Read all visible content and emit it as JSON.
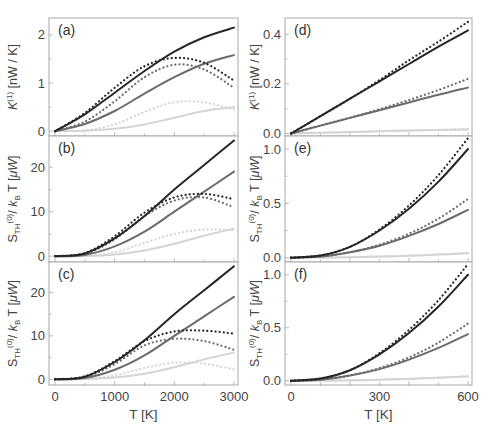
{
  "colors": {
    "dark": "#262626",
    "mid": "#6b6b6b",
    "light": "#d4d4d4",
    "frame": "#a8a8a8",
    "tick": "#444444"
  },
  "chart_data": [
    {
      "panel": "(a)",
      "type": "line",
      "column": "left",
      "ylabel": "K^(1) [nW / K]",
      "xlabel": "",
      "xlim": [
        0,
        3000
      ],
      "ylim": [
        -0.1,
        2.35
      ],
      "yticks": [
        0,
        1,
        2
      ],
      "yticklabels": [
        "0",
        "1",
        "2"
      ],
      "x": [
        0,
        500,
        1000,
        1500,
        2000,
        2500,
        3000
      ],
      "series": [
        {
          "name": "dark solid",
          "style": "solid",
          "shade": "dark",
          "values": [
            0,
            0.35,
            0.8,
            1.25,
            1.65,
            1.95,
            2.15
          ]
        },
        {
          "name": "dark dotted",
          "style": "dotted",
          "shade": "dark",
          "values": [
            0,
            0.38,
            0.9,
            1.35,
            1.52,
            1.42,
            1.05
          ]
        },
        {
          "name": "mid solid",
          "style": "solid",
          "shade": "mid",
          "values": [
            0,
            0.15,
            0.42,
            0.78,
            1.12,
            1.4,
            1.58
          ]
        },
        {
          "name": "mid dotted",
          "style": "dotted",
          "shade": "mid",
          "values": [
            0,
            0.2,
            0.62,
            1.12,
            1.38,
            1.28,
            0.9
          ]
        },
        {
          "name": "light solid",
          "style": "solid",
          "shade": "light",
          "values": [
            0,
            0.01,
            0.05,
            0.14,
            0.28,
            0.42,
            0.5
          ]
        },
        {
          "name": "light dotted",
          "style": "dotted",
          "shade": "light",
          "values": [
            0,
            0.02,
            0.14,
            0.4,
            0.6,
            0.6,
            0.45
          ]
        }
      ]
    },
    {
      "panel": "(b)",
      "type": "line",
      "column": "left",
      "ylabel": "S_TH^(0) / k_B T [μW]",
      "xlabel": "",
      "xlim": [
        0,
        3000
      ],
      "ylim": [
        -1.3,
        27
      ],
      "yticks": [
        0,
        10,
        20
      ],
      "yticklabels": [
        "0",
        "10",
        "20"
      ],
      "x": [
        0,
        500,
        1000,
        1500,
        2000,
        2500,
        3000
      ],
      "series": [
        {
          "name": "dark solid",
          "style": "solid",
          "shade": "dark",
          "values": [
            0,
            0.6,
            4,
            9,
            15,
            20.5,
            26
          ]
        },
        {
          "name": "dark dotted",
          "style": "dotted",
          "shade": "dark",
          "values": [
            0,
            0.7,
            4.5,
            9.8,
            13.2,
            14,
            12.8
          ]
        },
        {
          "name": "mid solid",
          "style": "solid",
          "shade": "mid",
          "values": [
            0,
            0.3,
            2.2,
            5.5,
            10,
            14.5,
            19
          ]
        },
        {
          "name": "mid dotted",
          "style": "dotted",
          "shade": "mid",
          "values": [
            0,
            0.5,
            3.8,
            9,
            12.5,
            13.2,
            11
          ]
        },
        {
          "name": "light solid",
          "style": "solid",
          "shade": "light",
          "values": [
            0,
            0.05,
            0.4,
            1.3,
            2.8,
            4.6,
            6.2
          ]
        },
        {
          "name": "light dotted",
          "style": "dotted",
          "shade": "light",
          "values": [
            0,
            0.1,
            0.9,
            3,
            5,
            6,
            5.8
          ]
        }
      ]
    },
    {
      "panel": "(c)",
      "type": "line",
      "column": "left",
      "ylabel": "S_TH^(0) / k_B T [μW]",
      "xlabel": "T [K]",
      "xlim": [
        0,
        3000
      ],
      "ylim": [
        -1.3,
        27
      ],
      "yticks": [
        0,
        10,
        20
      ],
      "yticklabels": [
        "0",
        "10",
        "20"
      ],
      "xticks": [
        0,
        1000,
        2000,
        3000
      ],
      "xticklabels": [
        "0",
        "1000",
        "2000",
        "3000"
      ],
      "x": [
        0,
        500,
        1000,
        1500,
        2000,
        2500,
        3000
      ],
      "series": [
        {
          "name": "dark solid",
          "style": "solid",
          "shade": "dark",
          "values": [
            0,
            0.6,
            4,
            9,
            15,
            20.5,
            26
          ]
        },
        {
          "name": "dark dotted",
          "style": "dotted",
          "shade": "dark",
          "values": [
            0,
            0.7,
            4.2,
            8.8,
            11,
            11.2,
            10.5
          ]
        },
        {
          "name": "mid solid",
          "style": "solid",
          "shade": "mid",
          "values": [
            0,
            0.3,
            2.2,
            5.5,
            10,
            14.5,
            19
          ]
        },
        {
          "name": "mid dotted",
          "style": "dotted",
          "shade": "mid",
          "values": [
            0,
            0.5,
            3.5,
            7.8,
            9.3,
            8.8,
            6.8
          ]
        },
        {
          "name": "light solid",
          "style": "solid",
          "shade": "light",
          "values": [
            0,
            0.05,
            0.4,
            1.3,
            2.8,
            4.6,
            6.2
          ]
        },
        {
          "name": "light dotted",
          "style": "dotted",
          "shade": "light",
          "values": [
            0,
            0.1,
            0.9,
            2.6,
            3.8,
            3.6,
            2.3
          ]
        }
      ]
    },
    {
      "panel": "(d)",
      "type": "line",
      "column": "right",
      "ylabel": "K^(1) [nW / K]",
      "xlabel": "",
      "xlim": [
        0,
        600
      ],
      "ylim": [
        -0.01,
        0.465
      ],
      "yticks": [
        0,
        0.2,
        0.4
      ],
      "yticklabels": [
        "0.0",
        "0.2",
        "0.4"
      ],
      "x": [
        0,
        100,
        200,
        300,
        400,
        500,
        600
      ],
      "series": [
        {
          "name": "dark solid",
          "style": "solid",
          "shade": "dark",
          "values": [
            0,
            0.07,
            0.14,
            0.21,
            0.28,
            0.35,
            0.415
          ]
        },
        {
          "name": "dark dotted",
          "style": "dotted",
          "shade": "dark",
          "values": [
            0,
            0.07,
            0.14,
            0.215,
            0.295,
            0.37,
            0.45
          ]
        },
        {
          "name": "mid solid",
          "style": "solid",
          "shade": "mid",
          "values": [
            0,
            0.032,
            0.063,
            0.094,
            0.125,
            0.156,
            0.185
          ]
        },
        {
          "name": "mid dotted",
          "style": "dotted",
          "shade": "mid",
          "values": [
            0,
            0.032,
            0.064,
            0.098,
            0.135,
            0.175,
            0.22
          ]
        },
        {
          "name": "light solid",
          "style": "solid",
          "shade": "light",
          "values": [
            0,
            0.003,
            0.006,
            0.009,
            0.012,
            0.014,
            0.016
          ]
        },
        {
          "name": "light dotted",
          "style": "dotted",
          "shade": "light",
          "values": [
            0,
            0.003,
            0.006,
            0.009,
            0.012,
            0.015,
            0.018
          ]
        }
      ]
    },
    {
      "panel": "(e)",
      "type": "line",
      "column": "right",
      "ylabel": "S_TH^(0) / k_B T [μW]",
      "xlabel": "",
      "xlim": [
        0,
        600
      ],
      "ylim": [
        -0.04,
        1.12
      ],
      "yticks": [
        0,
        0.5,
        1.0
      ],
      "yticklabels": [
        "0.0",
        "0.5",
        "1.0"
      ],
      "x": [
        0,
        100,
        200,
        300,
        400,
        500,
        600
      ],
      "series": [
        {
          "name": "dark solid",
          "style": "solid",
          "shade": "dark",
          "values": [
            0,
            0.02,
            0.1,
            0.25,
            0.45,
            0.7,
            1.0
          ]
        },
        {
          "name": "dark dotted",
          "style": "dotted",
          "shade": "dark",
          "values": [
            0,
            0.02,
            0.1,
            0.26,
            0.48,
            0.76,
            1.1
          ]
        },
        {
          "name": "mid solid",
          "style": "solid",
          "shade": "mid",
          "values": [
            0,
            0.01,
            0.05,
            0.11,
            0.2,
            0.31,
            0.44
          ]
        },
        {
          "name": "mid dotted",
          "style": "dotted",
          "shade": "mid",
          "values": [
            0,
            0.01,
            0.05,
            0.12,
            0.22,
            0.36,
            0.54
          ]
        },
        {
          "name": "light solid",
          "style": "solid",
          "shade": "light",
          "values": [
            0,
            0.001,
            0.004,
            0.01,
            0.018,
            0.028,
            0.04
          ]
        },
        {
          "name": "light dotted",
          "style": "dotted",
          "shade": "light",
          "values": [
            0,
            0.001,
            0.004,
            0.01,
            0.019,
            0.03,
            0.045
          ]
        }
      ]
    },
    {
      "panel": "(f)",
      "type": "line",
      "column": "right",
      "ylabel": "S_TH^(0) / k_B T [μW]",
      "xlabel": "T [K]",
      "xlim": [
        0,
        600
      ],
      "ylim": [
        -0.04,
        1.12
      ],
      "yticks": [
        0,
        0.5,
        1.0
      ],
      "yticklabels": [
        "0.0",
        "0.5",
        "1.0"
      ],
      "xticks": [
        0,
        300,
        600
      ],
      "xticklabels": [
        "0",
        "300",
        "600"
      ],
      "x": [
        0,
        100,
        200,
        300,
        400,
        500,
        600
      ],
      "series": [
        {
          "name": "dark solid",
          "style": "solid",
          "shade": "dark",
          "values": [
            0,
            0.02,
            0.1,
            0.25,
            0.45,
            0.7,
            1.0
          ]
        },
        {
          "name": "dark dotted",
          "style": "dotted",
          "shade": "dark",
          "values": [
            0,
            0.02,
            0.1,
            0.26,
            0.48,
            0.76,
            1.1
          ]
        },
        {
          "name": "mid solid",
          "style": "solid",
          "shade": "mid",
          "values": [
            0,
            0.01,
            0.05,
            0.11,
            0.2,
            0.31,
            0.44
          ]
        },
        {
          "name": "mid dotted",
          "style": "dotted",
          "shade": "mid",
          "values": [
            0,
            0.01,
            0.05,
            0.12,
            0.22,
            0.36,
            0.54
          ]
        },
        {
          "name": "light solid",
          "style": "solid",
          "shade": "light",
          "values": [
            0,
            0.001,
            0.004,
            0.01,
            0.018,
            0.028,
            0.04
          ]
        },
        {
          "name": "light dotted",
          "style": "dotted",
          "shade": "light",
          "values": [
            0,
            0.001,
            0.004,
            0.01,
            0.019,
            0.03,
            0.045
          ]
        }
      ]
    }
  ]
}
